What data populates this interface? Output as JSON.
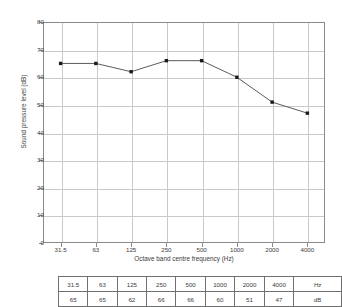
{
  "chart_data": {
    "type": "line",
    "title": "",
    "subtitle": "",
    "xlabel": "Octave band centre frequency (Hz)",
    "ylabel": "Sound pressure level (dB)",
    "categories": [
      "31.5",
      "63",
      "125",
      "250",
      "500",
      "1000",
      "2000",
      "4000"
    ],
    "values": [
      65,
      65,
      62,
      66,
      66,
      60,
      51,
      47
    ],
    "series": [
      {
        "name": "Sound pressure level",
        "values": [
          65,
          65,
          62,
          66,
          66,
          60,
          51,
          47
        ]
      }
    ],
    "ylim": [
      0,
      80
    ],
    "yticks": [
      0,
      10,
      20,
      30,
      40,
      50,
      60,
      70,
      80
    ],
    "ytick_labels": [
      "0",
      "10",
      "20",
      "30",
      "40",
      "50",
      "60",
      "70",
      "80"
    ],
    "xtick_labels": [
      "31.5",
      "63",
      "125",
      "250",
      "500",
      "1000",
      "2000",
      "4000"
    ],
    "grid": true,
    "legend": false,
    "marker": "square",
    "line_color": "#4a4a4a",
    "marker_color": "#1a1a1a",
    "grid_color": "#c9c9c9",
    "axis_color": "#8a8a8a"
  },
  "table": {
    "rows": [
      {
        "cells": [
          "31.5",
          "63",
          "125",
          "250",
          "500",
          "1000",
          "2000",
          "4000"
        ],
        "unit": "Hz"
      },
      {
        "cells": [
          "65",
          "65",
          "62",
          "66",
          "66",
          "60",
          "51",
          "47"
        ],
        "unit": "dB"
      }
    ]
  }
}
